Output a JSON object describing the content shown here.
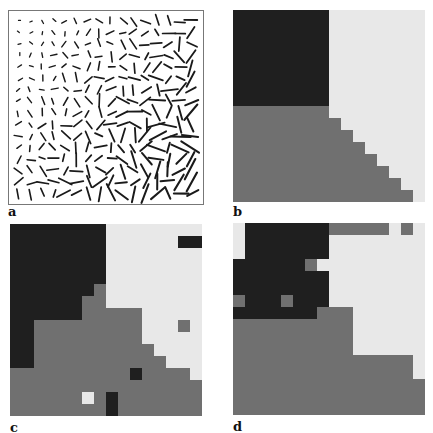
{
  "figure": {
    "panels": [
      {
        "id": "a",
        "label": "a",
        "type": "orientation-field",
        "description": "field of short line segments (oriented bars) whose length increases toward the lower-right"
      },
      {
        "id": "b",
        "label": "b",
        "type": "segmentation-map"
      },
      {
        "id": "c",
        "label": "c",
        "type": "segmentation-map"
      },
      {
        "id": "d",
        "label": "d",
        "type": "segmentation-map"
      }
    ],
    "colors": {
      "dark": "#1f1f1f",
      "gray": "#707070",
      "light": "#e8e8e8"
    },
    "grids": {
      "b": [
        "DDDDDDDDLLLLLLLL",
        "DDDDDDDDLLLLLLLL",
        "DDDDDDDDLLLLLLLL",
        "DDDDDDDDLLLLLLLL",
        "DDDDDDDDLLLLLLLL",
        "DDDDDDDDLLLLLLLL",
        "DDDDDDDDLLLLLLLL",
        "DDDDDDDDLLLLLLLL",
        "GGGGGGGGLLLLLLLL",
        "GGGGGGGGGLLLLLLL",
        "GGGGGGGGGGLLLLLL",
        "GGGGGGGGGGGLLLLL",
        "GGGGGGGGGGGGLLLL",
        "GGGGGGGGGGGGGLLL",
        "GGGGGGGGGGGGGGLL",
        "GGGGGGGGGGGGGGGL"
      ],
      "c": [
        "DDDDDDDDLLLLLLLL",
        "DDDDDDDDLLLLLLDD",
        "DDDDDDDDLLLLLLLL",
        "DDDDDDDDLLLLLLLL",
        "DDDDDDDDLLLLLLLL",
        "DDDDDDDGLLLLLLLL",
        "DDDDDDGGLLLLLLLL",
        "DDDDDDGGGGGLLLLL",
        "DDGGGGGGGGGLLLGL",
        "DDGGGGGGGGGLLLLL",
        "DDGGGGGGGGGGLLLL",
        "DDGGGGGGGGGGGLLL",
        "GGGGGGGGGGDGGGGL",
        "GGGGGGGGGGGGGGGG",
        "GGGGGGLGDGGGGGGG",
        "GGGGGGGGDGGGGGGG"
      ],
      "d": [
        "LDDDDDDDGGGGGLGL",
        "LDDDDDDDLLLLLLLL",
        "LDDDDDDDLLLLLLLL",
        "DDDDDDGLLLLLLLLL",
        "DDDDDDDDLLLLLLLL",
        "DDDDDDDDLLLLLLLL",
        "GDDDGDDDLLLLLLLL",
        "DDDDDDDGGGLLLLLL",
        "GGGGGGGGGGLLLLLL",
        "GGGGGGGGGGLLLLLL",
        "GGGGGGGGGGLLLLLL",
        "GGGGGGGGGGGGGGGL",
        "GGGGGGGGGGGGGGGL",
        "GGGGGGGGGGGGGGGG",
        "GGGGGGGGGGGGGGGG",
        "GGGGGGGGGGGGGGGG"
      ]
    }
  }
}
